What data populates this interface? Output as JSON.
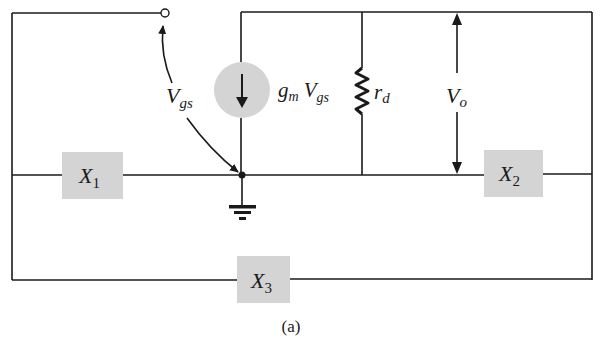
{
  "diagram": {
    "type": "small-signal equivalent circuit",
    "caption": "(a)",
    "colors": {
      "wire": "#1a1a1a",
      "component_fill": "#d4d4d4",
      "background": "#ffffff"
    },
    "components": {
      "current_source": {
        "label_main": "g",
        "label_main_sub": "m",
        "label_ctrl": "V",
        "label_ctrl_sub": "gs",
        "direction": "down"
      },
      "resistor": {
        "label": "r",
        "label_sub": "d"
      },
      "output_voltage": {
        "label": "V",
        "label_sub": "o"
      },
      "control_voltage": {
        "label": "V",
        "label_sub": "gs"
      },
      "x1": {
        "label": "X",
        "label_sub": "1"
      },
      "x2": {
        "label": "X",
        "label_sub": "2"
      },
      "x3": {
        "label": "X",
        "label_sub": "3"
      },
      "ground": {
        "symbol": "ground"
      },
      "gate_terminal": {
        "symbol": "open-terminal"
      }
    }
  }
}
